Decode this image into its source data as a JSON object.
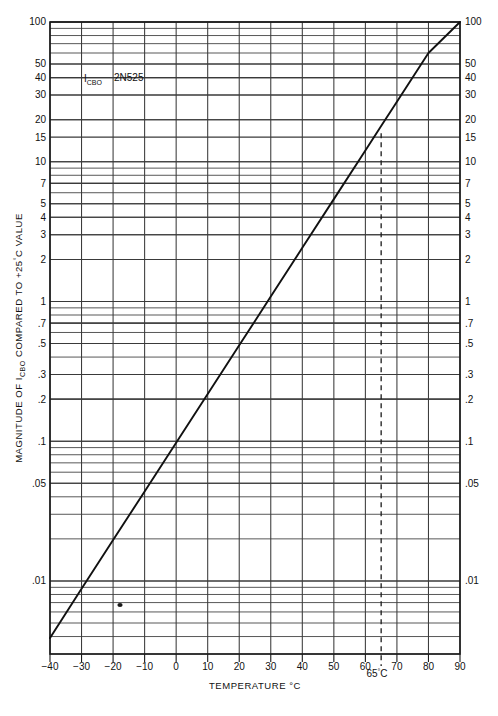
{
  "chart_data": {
    "type": "line",
    "title": "",
    "xlabel": "TEMPERATURE °C",
    "ylabel": "MAGNITUDE OF ICBO COMPARED TO +25°C VALUE",
    "ylabel_parts": {
      "pre": "MAGNITUDE OF I",
      "sub": "CBO",
      "post": " COMPARED TO +25",
      "deg": "°",
      "tail": "C VALUE"
    },
    "xlim": [
      -40,
      90
    ],
    "ylim": [
      0.003,
      100
    ],
    "yscale": "log",
    "xscale": "linear",
    "grid": true,
    "legend": "none",
    "x_ticks": [
      -40,
      -30,
      -20,
      -10,
      0,
      10,
      20,
      30,
      40,
      50,
      60,
      70,
      80,
      90
    ],
    "x_tick_labels": [
      "−40",
      "−30",
      "−20",
      "−10",
      "0",
      "10",
      "20",
      "30",
      "40",
      "50",
      "60",
      "70",
      "80",
      "90"
    ],
    "y_major_ticks": [
      100,
      50,
      40,
      30,
      20,
      15,
      10,
      7,
      5,
      4,
      3,
      2,
      1,
      0.7,
      0.5,
      0.3,
      0.2,
      0.1,
      0.05,
      0.01
    ],
    "y_major_tick_labels": [
      "100",
      "50",
      "40",
      "30",
      "20",
      "15",
      "10",
      "7",
      "5",
      "4",
      "3",
      "2",
      "1",
      ".7",
      ".5",
      ".3",
      ".2",
      ".1",
      ".05",
      ".01"
    ],
    "series": [
      {
        "name": "ICBO vs temperature (2N525)",
        "style": "solid",
        "x": [
          -40,
          -30,
          -20,
          -10,
          0,
          10,
          20,
          25,
          30,
          40,
          50,
          60,
          65,
          70,
          80,
          90
        ],
        "values": [
          0.0039,
          0.0088,
          0.0196,
          0.0437,
          0.0975,
          0.218,
          0.486,
          0.725,
          1.085,
          2.42,
          5.4,
          12.05,
          18.0,
          26.9,
          60.0,
          100.0
        ]
      }
    ],
    "annotations": [
      {
        "name": "icbo-label",
        "text_pre": "I",
        "text_sub": "CBO",
        "x": -19,
        "y": 35
      },
      {
        "name": "device-label",
        "text": "2N525",
        "x": -6,
        "y": 35
      },
      {
        "name": "reference-marker",
        "text_pre": "65",
        "deg": "°",
        "text_post": "C",
        "x": 65,
        "y": 0.003,
        "style": "dashed-vertical",
        "to_y": 16
      }
    ],
    "reference_line": {
      "name": "65c-dashed-line",
      "x": 65,
      "label_pre": "65",
      "label_deg": "°",
      "label_post": "C",
      "dash": "5,4"
    }
  },
  "figure": {
    "background": "#ffffff",
    "grid_color": "#3a3a3a",
    "frame_color": "#1a1a1a",
    "curve_color": "#111111"
  }
}
